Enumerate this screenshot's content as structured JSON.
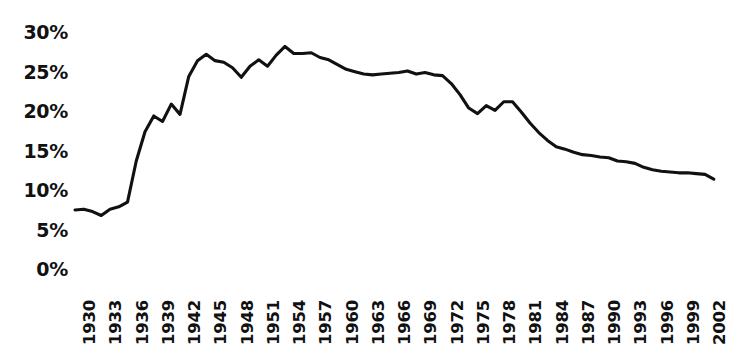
{
  "chart_data": {
    "type": "line",
    "title": "",
    "subtitle": "",
    "xlabel": "",
    "ylabel": "",
    "grid": false,
    "legend": "none",
    "xlim": [
      1930,
      2003
    ],
    "ylim": [
      0,
      30
    ],
    "y_ticks": [
      30,
      25,
      20,
      15,
      10,
      5,
      0
    ],
    "y_tick_labels": [
      "30%",
      "25%",
      "20%",
      "15%",
      "10%",
      "5%",
      "0%"
    ],
    "x_ticks": [
      1930,
      1933,
      1936,
      1939,
      1942,
      1945,
      1948,
      1951,
      1954,
      1957,
      1960,
      1963,
      1966,
      1969,
      1972,
      1975,
      1978,
      1981,
      1984,
      1987,
      1990,
      1993,
      1996,
      1999,
      2002
    ],
    "x_tick_labels": [
      "1930",
      "1933",
      "1936",
      "1939",
      "1942",
      "1945",
      "1948",
      "1951",
      "1954",
      "1957",
      "1960",
      "1963",
      "1966",
      "1969",
      "1972",
      "1975",
      "1978",
      "1981",
      "1984",
      "1987",
      "1990",
      "1993",
      "1996",
      "1999",
      "2002"
    ],
    "x_tick_rotation": -90,
    "series": [
      {
        "name": "series-1",
        "color": "#111111",
        "x": [
          1930,
          1931,
          1932,
          1933,
          1934,
          1935,
          1936,
          1937,
          1938,
          1939,
          1940,
          1941,
          1942,
          1943,
          1944,
          1945,
          1946,
          1947,
          1948,
          1949,
          1950,
          1951,
          1952,
          1953,
          1954,
          1955,
          1956,
          1957,
          1958,
          1959,
          1960,
          1961,
          1962,
          1963,
          1964,
          1965,
          1966,
          1967,
          1968,
          1969,
          1970,
          1971,
          1972,
          1973,
          1974,
          1975,
          1976,
          1977,
          1978,
          1979,
          1980,
          1981,
          1982,
          1983,
          1984,
          1985,
          1986,
          1987,
          1988,
          1989,
          1990,
          1991,
          1992,
          1993,
          1994,
          1995,
          1996,
          1997,
          1998,
          1999,
          2000,
          2001,
          2002,
          2003
        ],
        "y": [
          7.6,
          7.7,
          7.4,
          6.9,
          7.7,
          8.0,
          8.6,
          13.8,
          17.5,
          19.5,
          18.8,
          21.0,
          19.7,
          24.5,
          26.5,
          27.3,
          26.5,
          26.3,
          25.6,
          24.4,
          25.8,
          26.6,
          25.8,
          27.2,
          28.3,
          27.4,
          27.4,
          27.5,
          26.9,
          26.6,
          26.0,
          25.4,
          25.1,
          24.8,
          24.7,
          24.8,
          24.9,
          25.0,
          25.2,
          24.8,
          25.0,
          24.7,
          24.6,
          23.6,
          22.2,
          20.5,
          19.8,
          20.8,
          20.2,
          21.3,
          21.3,
          20.0,
          18.6,
          17.4,
          16.4,
          15.6,
          15.3,
          14.9,
          14.6,
          14.5,
          14.3,
          14.2,
          13.8,
          13.7,
          13.5,
          13.0,
          12.7,
          12.5,
          12.4,
          12.3,
          12.3,
          12.2,
          12.1,
          11.5
        ]
      }
    ]
  },
  "axes": {
    "y_axis_name": "percent-axis",
    "x_axis_name": "year-axis"
  }
}
